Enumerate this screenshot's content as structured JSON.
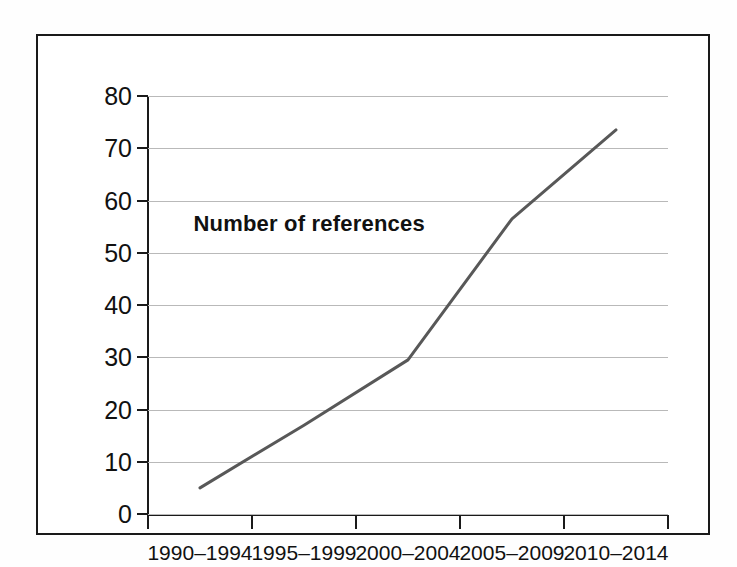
{
  "chart_data": {
    "type": "line",
    "title": "Number of references",
    "xlabel": "",
    "ylabel": "",
    "categories": [
      "1990–1994",
      "1995–1999",
      "2000–2004",
      "2005–2009",
      "2010–2014"
    ],
    "values": [
      5,
      17,
      29.5,
      56.5,
      73.5
    ],
    "series": [
      {
        "name": "Number of references",
        "values": [
          5,
          17,
          29.5,
          56.5,
          73.5
        ]
      }
    ],
    "ylim": [
      0,
      80
    ],
    "ytick_values": [
      0,
      10,
      20,
      30,
      40,
      50,
      60,
      70,
      80
    ],
    "ytick_labels": [
      "0",
      "10",
      "20",
      "30",
      "40",
      "50",
      "60",
      "70",
      "80"
    ],
    "grid": true,
    "grid_axis": "y",
    "legend": false,
    "legend_position": "none",
    "line_color": "#585858",
    "grid_color": "#b9b9b9",
    "axis_color": "#1a1a1a",
    "background_color": "#ffffff",
    "title_inside_plot": true
  }
}
